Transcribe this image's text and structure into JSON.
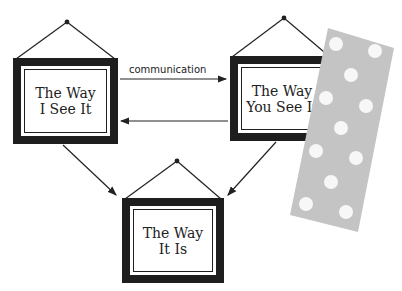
{
  "diagram": {
    "frames": [
      {
        "id": "frame-way-i-see-it",
        "label": "The Way\nI See It"
      },
      {
        "id": "frame-way-you-see-it",
        "label": "The Way\nYou See It"
      },
      {
        "id": "frame-way-it-is",
        "label": "The Way\nIt Is"
      }
    ],
    "edges": [
      {
        "from": "The Way I See It",
        "to": "The Way You See It",
        "label": "communication"
      },
      {
        "from": "The Way You See It",
        "to": "The Way I See It",
        "label": ""
      },
      {
        "from": "The Way I See It",
        "to": "The Way It Is",
        "label": ""
      },
      {
        "from": "The Way You See It",
        "to": "The Way It Is",
        "label": ""
      }
    ],
    "edge_label": "communication",
    "sticker": {
      "description": "gray strip with white dots",
      "color": "#c4c4c4",
      "dot_color": "#f7f7f7",
      "dot_count": 12
    }
  }
}
